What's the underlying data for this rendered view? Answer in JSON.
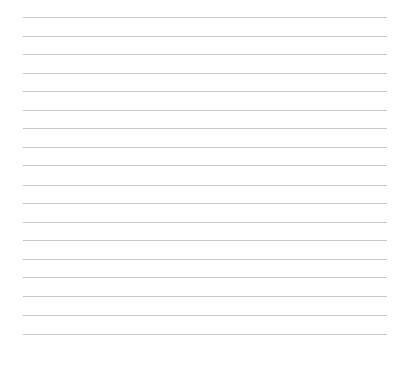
{
  "page": {
    "type": "lined-paper",
    "background_color": "#ffffff",
    "rule_color": "#c9c9c9",
    "rule_count": 18,
    "rules": [
      {
        "y": 17
      },
      {
        "y": 36
      },
      {
        "y": 54
      },
      {
        "y": 73
      },
      {
        "y": 91
      },
      {
        "y": 110
      },
      {
        "y": 128
      },
      {
        "y": 147
      },
      {
        "y": 165
      },
      {
        "y": 185
      },
      {
        "y": 203
      },
      {
        "y": 222
      },
      {
        "y": 240
      },
      {
        "y": 259
      },
      {
        "y": 277
      },
      {
        "y": 296
      },
      {
        "y": 315
      },
      {
        "y": 334
      }
    ]
  }
}
